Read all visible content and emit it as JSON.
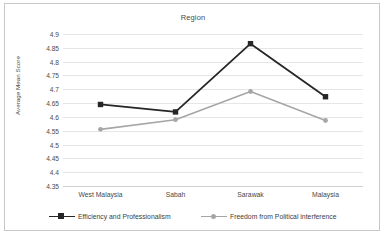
{
  "chart_data": {
    "type": "line",
    "title": "Region",
    "xlabel": "",
    "ylabel": "Average Mean Score",
    "categories": [
      "West Malaysia",
      "Sabah",
      "Sarawak",
      "Malaysia"
    ],
    "ylim": [
      4.35,
      4.9
    ],
    "yticks": [
      "4.35",
      "4.4",
      "4.45",
      "4.5",
      "4.55",
      "4.6",
      "4.65",
      "4.7",
      "4.75",
      "4.8",
      "4.85",
      "4.9"
    ],
    "ytick_values": [
      4.35,
      4.4,
      4.45,
      4.5,
      4.55,
      4.6,
      4.65,
      4.7,
      4.75,
      4.8,
      4.85,
      4.9
    ],
    "grid": true,
    "legend_position": "bottom",
    "series": [
      {
        "name": "Efficiency and Professionalism",
        "values": [
          4.645,
          4.618,
          4.865,
          4.673
        ],
        "color": "#262626",
        "marker": "square"
      },
      {
        "name": "Freedom from Political interference",
        "values": [
          4.555,
          4.59,
          4.692,
          4.587
        ],
        "color": "#a6a6a6",
        "marker": "circle"
      }
    ]
  },
  "colors": {
    "series_efficiency": "#262626",
    "series_freedom": "#a6a6a6",
    "gridline": "#e6e6e6",
    "border": "#c9c9c9",
    "text": "#4a4a4a",
    "background": "#ffffff"
  }
}
